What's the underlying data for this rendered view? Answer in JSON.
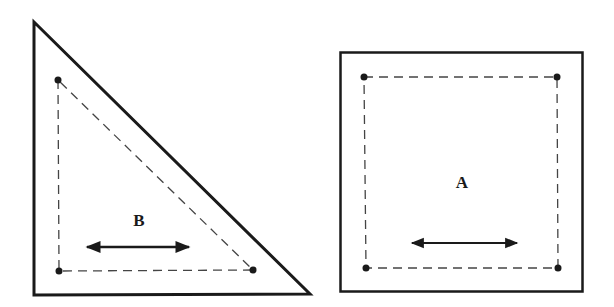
{
  "diagram": {
    "colors": {
      "stroke": "#1a1a1a",
      "dashed": "#444444",
      "background": "#ffffff"
    },
    "shapes": [
      {
        "id": "triangle",
        "label": "B",
        "outer": [
          [
            34,
            22
          ],
          [
            34,
            295
          ],
          [
            310,
            294
          ]
        ],
        "inner": [
          [
            58,
            80
          ],
          [
            59,
            271
          ],
          [
            253,
            270
          ]
        ],
        "label_pos": [
          139,
          226
        ],
        "arrow": [
          [
            85,
            247
          ],
          [
            190,
            247
          ]
        ]
      },
      {
        "id": "square",
        "label": "A",
        "outer_rect": [
          340,
          52,
          583,
          292
        ],
        "inner": [
          [
            364,
            77
          ],
          [
            557,
            77
          ],
          [
            558,
            268
          ],
          [
            366,
            268
          ]
        ],
        "label_pos": [
          462,
          188
        ],
        "arrow": [
          [
            410,
            243
          ],
          [
            518,
            243
          ]
        ]
      }
    ]
  }
}
